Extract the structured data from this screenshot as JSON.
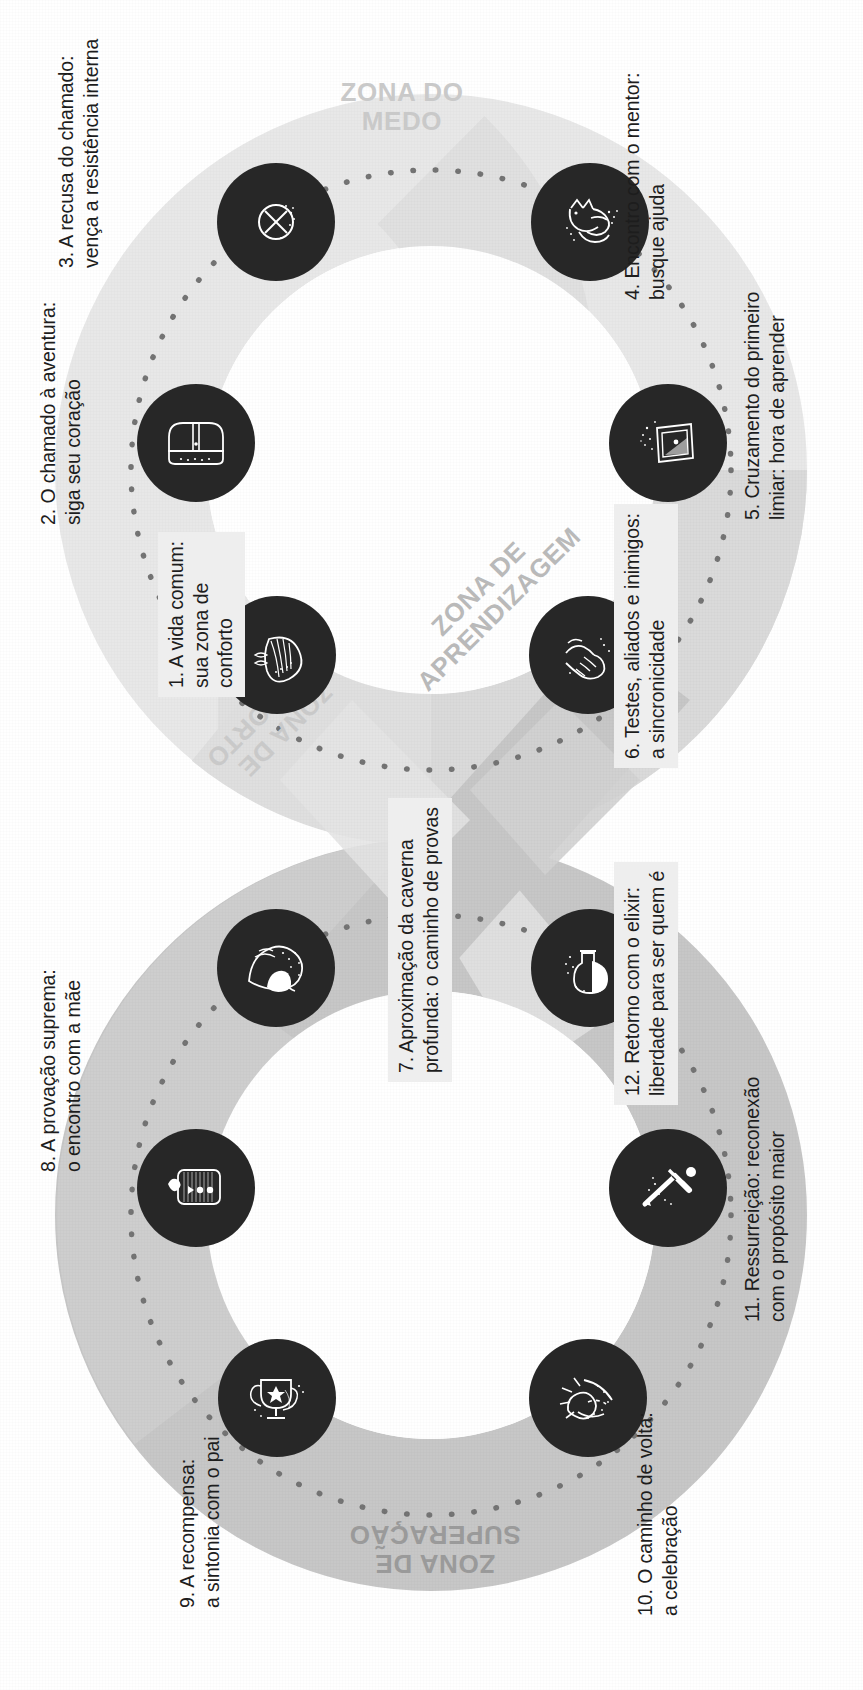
{
  "diagram": {
    "colors": {
      "band_light": "#d9d9d9",
      "band_mid": "#c9c9c9",
      "band_dark": "#a6a6a6",
      "node_fill": "#272727",
      "node_stroke": "#ffffff",
      "label_text": "#1d1d1d",
      "zone_text": "#c3c3c3",
      "box_bg": "#eeeeee",
      "background": "#ffffff"
    }
  },
  "zones": [
    {
      "id": "medo",
      "line1": "ZONA DO",
      "line2": "MEDO"
    },
    {
      "id": "aprendizagem",
      "line1": "ZONA DE",
      "line2": "APRENDIZAGEM"
    },
    {
      "id": "conforto",
      "line1": "ZONA DE",
      "line2": "CONFORTO"
    },
    {
      "id": "superacao",
      "line1": "ZONA DE",
      "line2": "SUPERACAO_DISPLAY"
    }
  ],
  "zone_text": {
    "medo_1": "ZONA DO",
    "medo_2": "MEDO",
    "aprendizagem_1": "ZONA DE",
    "aprendizagem_2": "APRENDIZAGEM",
    "conforto_1": "ZONA DE",
    "conforto_2": "CONFORTO",
    "superacao_1": "ZONA DE",
    "superacao_2": "SUPERAÇÃO"
  },
  "steps": [
    {
      "number": "1.",
      "line1": "1. A vida comum:",
      "line2": "sua zona de",
      "line3": "conforto",
      "icon": "shell-icon",
      "boxed": true
    },
    {
      "number": "2.",
      "line1": "2. O chamado à aventura:",
      "line2": "siga seu coração",
      "icon": "treasure-chest-icon",
      "boxed": false
    },
    {
      "number": "3.",
      "line1": "3. A recusa do chamado:",
      "line2": "vença a resistência interna",
      "icon": "no-entry-icon",
      "boxed": false
    },
    {
      "number": "4.",
      "line1": "4. Encontro com o mentor:",
      "line2": "busque ajuda",
      "icon": "owl-icon",
      "boxed": false
    },
    {
      "number": "5.",
      "line1": "5. Cruzamento do primeiro",
      "line2": "limiar: hora de aprender",
      "icon": "portal-door-icon",
      "boxed": false
    },
    {
      "number": "6.",
      "line1": "6. Testes, aliados e inimigos:",
      "line2": "a sincronicidade",
      "icon": "handshake-icon",
      "boxed": true
    },
    {
      "number": "7.",
      "line1": "7. Aproximação da caverna",
      "line2": "profunda: o caminho de provas",
      "icon": "cave-icon",
      "boxed": true
    },
    {
      "number": "8.",
      "line1": "8. A provação suprema:",
      "line2": "o encontro com a mãe",
      "icon": "cocoon-icon",
      "boxed": false
    },
    {
      "number": "9.",
      "line1": "9. A recompensa:",
      "line2": "a sintonia com o pai",
      "icon": "trophy-icon",
      "boxed": false
    },
    {
      "number": "10.",
      "line1": "10. O caminho de volta:",
      "line2": "a celebração",
      "icon": "shooting-star-icon",
      "boxed": false
    },
    {
      "number": "11.",
      "line1": "11. Ressurreição: reconexão",
      "line2": "com o propósito maior",
      "icon": "sword-icon",
      "boxed": false
    },
    {
      "number": "12.",
      "line1": "12. Retorno com o elixir:",
      "line2": "liberdade para ser quem é",
      "icon": "elixir-flask-icon",
      "boxed": true
    }
  ]
}
